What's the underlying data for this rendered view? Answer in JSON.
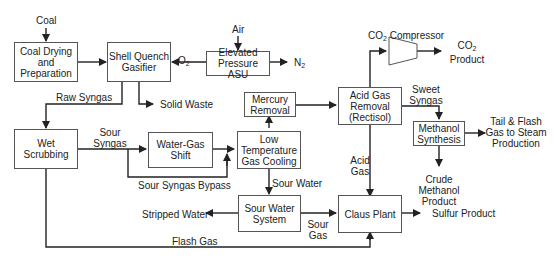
{
  "boxes": {
    "coal_drying": "Coal Drying and Preparation",
    "gasifier": "Shell Quench Gasifier",
    "asu": "Elevated Pressure ASU",
    "wet_scrubbing": "Wet Scrubbing",
    "wgs": "Water-Gas Shift",
    "ltgc": "Low Temperature Gas Cooling",
    "mercury": "Mercury Removal",
    "agr": "Acid Gas Removal (Rectisol)",
    "methanol": "Methanol Synthesis",
    "sour_water": "Sour Water System",
    "claus": "Claus Plant",
    "compressor": "CO2 Compressor"
  },
  "streams": {
    "coal": "Coal",
    "air": "Air",
    "o2": "O2",
    "n2": "N2",
    "raw_syngas": "Raw Syngas",
    "solid_waste": "Solid Waste",
    "sour_syngas": "Sour Syngas",
    "bypass": "Sour Syngas Bypass",
    "sour_water": "Sour Water",
    "stripped_water": "Stripped Water",
    "sour_gas": "Sour Gas",
    "flash_gas": "Flash Gas",
    "acid_gas": "Acid Gas",
    "sweet_syngas": "Sweet Syngas",
    "co2_product": "CO2 Product",
    "tail_gas": "Tail & Flash Gas to Steam Production",
    "crude_methanol": "Crude Methanol Product",
    "sulfur": "Sulfur Product"
  }
}
